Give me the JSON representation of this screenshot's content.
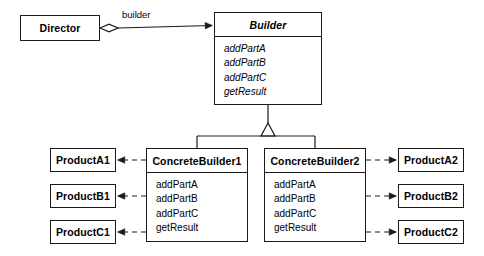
{
  "diagram": {
    "type": "uml-class-diagram",
    "stroke_color": "#1a1a1a",
    "background_color": "#ffffff"
  },
  "classes": {
    "director": {
      "name": "Director",
      "abstract": false,
      "operations": []
    },
    "builder": {
      "name": "Builder",
      "abstract": true,
      "operations": [
        "addPartA",
        "addPartB",
        "addPartC",
        "getResult"
      ]
    },
    "concrete_builder_1": {
      "name": "ConcreteBuilder1",
      "abstract": false,
      "operations": [
        "addPartA",
        "addPartB",
        "addPartC",
        "getResult"
      ]
    },
    "concrete_builder_2": {
      "name": "ConcreteBuilder2",
      "abstract": false,
      "operations": [
        "addPartA",
        "addPartB",
        "addPartC",
        "getResult"
      ]
    },
    "product_a1": {
      "name": "ProductA1",
      "abstract": false,
      "operations": []
    },
    "product_b1": {
      "name": "ProductB1",
      "abstract": false,
      "operations": []
    },
    "product_c1": {
      "name": "ProductC1",
      "abstract": false,
      "operations": []
    },
    "product_a2": {
      "name": "ProductA2",
      "abstract": false,
      "operations": []
    },
    "product_b2": {
      "name": "ProductB2",
      "abstract": false,
      "operations": []
    },
    "product_c2": {
      "name": "ProductC2",
      "abstract": false,
      "operations": []
    }
  },
  "relationships": {
    "aggregation": {
      "role_label": "builder",
      "from": "Director",
      "to": "Builder",
      "kind": "aggregation-with-navigable-arrow"
    },
    "generalizations": [
      {
        "from": "ConcreteBuilder1",
        "to": "Builder",
        "kind": "generalization"
      },
      {
        "from": "ConcreteBuilder2",
        "to": "Builder",
        "kind": "generalization"
      }
    ],
    "dependencies": [
      {
        "from": "ConcreteBuilder1",
        "to": "ProductA1",
        "kind": "dependency"
      },
      {
        "from": "ConcreteBuilder1",
        "to": "ProductB1",
        "kind": "dependency"
      },
      {
        "from": "ConcreteBuilder1",
        "to": "ProductC1",
        "kind": "dependency"
      },
      {
        "from": "ConcreteBuilder2",
        "to": "ProductA2",
        "kind": "dependency"
      },
      {
        "from": "ConcreteBuilder2",
        "to": "ProductB2",
        "kind": "dependency"
      },
      {
        "from": "ConcreteBuilder2",
        "to": "ProductC2",
        "kind": "dependency"
      }
    ]
  }
}
